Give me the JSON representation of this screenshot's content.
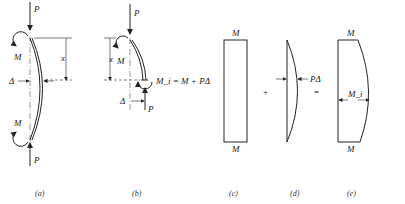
{
  "figure": {
    "panels": [
      {
        "id": "a",
        "caption": "(a)",
        "labels": {
          "force_top": "P",
          "moment_top": "M",
          "distance": "x",
          "deflection": "Δ",
          "moment_bottom": "M",
          "force_bottom": "P"
        }
      },
      {
        "id": "b",
        "caption": "(b)",
        "labels": {
          "force_top": "P",
          "moment_top": "M",
          "distance": "x",
          "internal_moment": "M_i = M + PΔ",
          "deflection": "Δ",
          "force_bottom": "P"
        }
      },
      {
        "id": "c",
        "caption": "(c)",
        "labels": {
          "top": "M",
          "bottom": "M"
        }
      },
      {
        "id": "d",
        "caption": "(d)",
        "labels": {
          "arrow": "PΔ"
        }
      },
      {
        "id": "e",
        "caption": "(e)",
        "labels": {
          "top": "M",
          "middle": "M_i",
          "bottom": "M"
        }
      }
    ],
    "operators": {
      "plus": "+",
      "equals": "="
    }
  }
}
